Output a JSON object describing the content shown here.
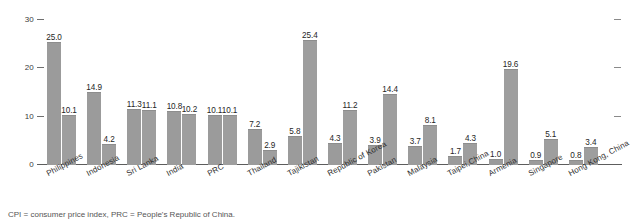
{
  "chart_data": {
    "type": "bar",
    "title": "",
    "subtitle": "",
    "xlabel": "",
    "ylabel": "",
    "ylim": [
      0,
      30
    ],
    "yticks": [
      0,
      10,
      20,
      30
    ],
    "ytick_labels": [
      "0",
      "10",
      "20",
      "30"
    ],
    "grid": false,
    "legend": "none",
    "legend_entries": [],
    "categories": [
      "Philippines",
      "Indonesia",
      "Sri Lanka",
      "India",
      "PRC",
      "Thailand",
      "Tajikistan",
      "Republic of Korea",
      "Pakistan",
      "Malaysia",
      "Taipei,China",
      "Armenia",
      "Singapore",
      "Hong Kong, China"
    ],
    "series": [
      {
        "name": "series-1",
        "values": [
          25.0,
          14.9,
          11.3,
          10.8,
          10.1,
          7.2,
          5.8,
          4.3,
          3.9,
          3.7,
          1.7,
          1.0,
          0.9,
          0.8
        ]
      },
      {
        "name": "series-2",
        "values": [
          10.1,
          4.2,
          11.1,
          10.2,
          10.1,
          2.9,
          25.4,
          11.2,
          14.4,
          8.1,
          4.3,
          19.6,
          5.1,
          3.4
        ]
      }
    ],
    "bar_labels": [
      [
        "25.0",
        "10.1"
      ],
      [
        "14.9",
        "4.2"
      ],
      [
        "11.3",
        "11.1"
      ],
      [
        "10.8",
        "10.2"
      ],
      [
        "10.1",
        "10.1"
      ],
      [
        "7.2",
        "2.9"
      ],
      [
        "5.8",
        "25.4"
      ],
      [
        "4.3",
        "11.2"
      ],
      [
        "3.9",
        "14.4"
      ],
      [
        "3.7",
        "8.1"
      ],
      [
        "1.7",
        "4.3"
      ],
      [
        "1.0",
        "19.6"
      ],
      [
        "0.9",
        "5.1"
      ],
      [
        "0.8",
        "3.4"
      ]
    ],
    "colors": {
      "bar_series_1": "#9b9b9b",
      "bar_series_2": "#9e9e9e",
      "axis": "#5d5d5d",
      "text": "#2b2b2b"
    },
    "footnote": "CPI = consumer price index, PRC = People's Republic of China."
  }
}
